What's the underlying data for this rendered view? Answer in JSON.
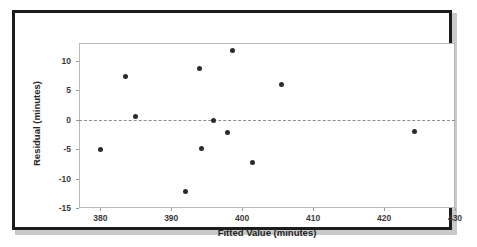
{
  "chart_data": {
    "type": "scatter",
    "title": "",
    "xlabel": "Fitted Value (minutes)",
    "ylabel": "Residual (minutes)",
    "xlim": [
      377,
      430
    ],
    "ylim": [
      -15,
      13
    ],
    "xticks": [
      380,
      390,
      400,
      410,
      420,
      430
    ],
    "yticks": [
      10,
      5,
      0,
      -5,
      -10,
      -15
    ],
    "xtick_labels": [
      "380",
      "390",
      "400",
      "410",
      "420",
      "430"
    ],
    "ytick_labels": [
      "10",
      "5",
      "0",
      "-5",
      "-10",
      "-15"
    ],
    "grid": false,
    "legend": null,
    "reference_line": {
      "orientation": "horizontal",
      "y": 0,
      "style": "dashed",
      "color": "#8e8e8e"
    },
    "marker": {
      "shape": "circle",
      "color": "#2b2b2b",
      "size": 5
    },
    "points": [
      {
        "x": 380.0,
        "y": -5.0
      },
      {
        "x": 383.6,
        "y": 7.4
      },
      {
        "x": 385.0,
        "y": 0.5
      },
      {
        "x": 392.0,
        "y": -12.2
      },
      {
        "x": 394.0,
        "y": 8.7
      },
      {
        "x": 394.2,
        "y": -4.9
      },
      {
        "x": 396.0,
        "y": -0.1
      },
      {
        "x": 398.0,
        "y": -2.2
      },
      {
        "x": 398.7,
        "y": 11.7
      },
      {
        "x": 401.5,
        "y": -7.2
      },
      {
        "x": 405.6,
        "y": 5.9
      },
      {
        "x": 424.3,
        "y": -2.0
      }
    ]
  },
  "figure": {
    "border_color": "#1c1c1c",
    "background": "#ffffff",
    "axis_color": "#b9b9b9"
  }
}
